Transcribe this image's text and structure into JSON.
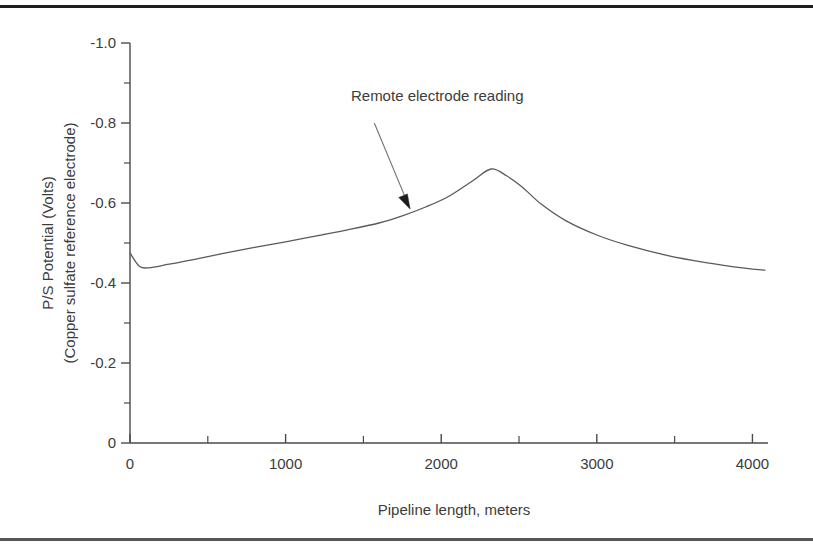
{
  "figure": {
    "background_color": "#ffffff",
    "line_color": "#5a5a5a",
    "axis_color": "#4a4a4a",
    "text_color": "#3c3c3c",
    "rule_color": "#1e1e1e"
  },
  "chart_data": {
    "type": "line",
    "title": "",
    "xlabel": "Pipeline length, meters",
    "ylabel_line1": "P/S Potential (Volts)",
    "ylabel_line2": "(Copper sulfate reference electrode)",
    "xlim": [
      0,
      4100
    ],
    "ylim": [
      0,
      -1.0
    ],
    "grid": false,
    "legend": null,
    "x_ticks_major": [
      0,
      1000,
      2000,
      3000,
      4000
    ],
    "x_tick_labels": [
      "0",
      "1000",
      "2000",
      "3000",
      "4000"
    ],
    "x_ticks_minor": [
      500,
      1500,
      2500,
      3500
    ],
    "y_ticks_major": [
      0,
      -0.2,
      -0.4,
      -0.6,
      -0.8,
      -1.0
    ],
    "y_tick_labels": [
      "0",
      "-0.2",
      "-0.4",
      "-0.6",
      "-0.8",
      "-1.0"
    ],
    "y_ticks_minor": [
      -0.1,
      -0.3,
      -0.5,
      -0.7,
      -0.9
    ],
    "series": [
      {
        "name": "Remote electrode reading",
        "x": [
          0,
          60,
          120,
          250,
          400,
          600,
          800,
          1000,
          1200,
          1400,
          1600,
          1750,
          1900,
          2050,
          2200,
          2320,
          2420,
          2520,
          2640,
          2800,
          3000,
          3200,
          3450,
          3700,
          3950,
          4080
        ],
        "y": [
          -0.475,
          -0.442,
          -0.438,
          -0.447,
          -0.458,
          -0.474,
          -0.489,
          -0.503,
          -0.518,
          -0.533,
          -0.55,
          -0.568,
          -0.59,
          -0.617,
          -0.655,
          -0.685,
          -0.668,
          -0.64,
          -0.598,
          -0.556,
          -0.52,
          -0.494,
          -0.469,
          -0.451,
          -0.437,
          -0.432
        ]
      }
    ],
    "annotations": [
      {
        "text": "Remote electrode reading",
        "text_x": 1420,
        "text_y": -0.855,
        "arrow_from_x": 1570,
        "arrow_from_y": -0.8,
        "arrow_to_x": 1800,
        "arrow_to_y": -0.585
      }
    ]
  }
}
